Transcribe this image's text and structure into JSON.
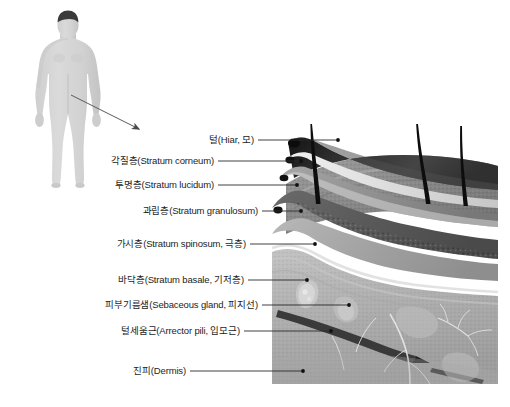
{
  "document": {
    "kind": "anatomy-diagram",
    "subject": "Skin cross-section (피부 단면)",
    "language": "ko"
  },
  "figure": {
    "name": "human-body-silhouette",
    "body_color": "#d3d3d3",
    "hair_color": "#3a3a3a",
    "shadow_color": "#c3c3c3"
  },
  "pointer": {
    "name": "zoom-arrow",
    "color": "#4a4a4a",
    "from": "body-abdomen",
    "to": "skin-illustration"
  },
  "labels": [
    {
      "ko": "털",
      "en": "(Hiar, 모)",
      "text": "털(Hiar, 모)"
    },
    {
      "ko": "각질층",
      "en": "(Stratum corneum)",
      "text": "각질층(Stratum corneum)"
    },
    {
      "ko": "투명층",
      "en": "(Stratum lucidum)",
      "text": "투명층(Stratum lucidum)"
    },
    {
      "ko": "과립층",
      "en": "(Stratum granulosum)",
      "text": "과립층(Stratum granulosum)"
    },
    {
      "ko": "가시층",
      "en": "(Stratum spinosum, 극층)",
      "text": "가시층(Stratum spinosum, 극층)"
    },
    {
      "ko": "바닥층",
      "en": "(Stratum basale, 기저층)",
      "text": "바닥층(Stratum basale, 기저층)"
    },
    {
      "ko": "피부기름샘",
      "en": "(Sebaceous gland, 피지선)",
      "text": "피부기름샘(Sebaceous gland, 피지선)"
    },
    {
      "ko": "털세움근",
      "en": "(Arrector pili, 입모근)",
      "text": "털세움근(Arrector pili, 입모근)"
    },
    {
      "ko": "진피",
      "en": "(Dermis)",
      "text": "진피(Dermis)"
    }
  ],
  "leader_line": {
    "color": "#2b2b2b",
    "dot_color": "#111111",
    "width_px": 0.9
  },
  "illustration": {
    "name": "skin-cross-section-render",
    "style": "grayscale 3D medical render",
    "layers": [
      {
        "name": "stratum-corneum",
        "tone": "#2c2c2c"
      },
      {
        "name": "stratum-lucidum",
        "tone": "#e9e9e9"
      },
      {
        "name": "stratum-granulosum",
        "tone": "#9a9a9a"
      },
      {
        "name": "stratum-spinosum",
        "tone": "#6e6e6e"
      },
      {
        "name": "stratum-basale",
        "tone": "#888888"
      },
      {
        "name": "dermis",
        "tone": "#b4b4b4"
      }
    ],
    "structures": [
      "hair-shaft",
      "hair-follicle",
      "sebaceous-gland",
      "arrector-pili-muscle",
      "nerve-branch",
      "blood-vessel"
    ],
    "hair_count": 3
  },
  "bottom_caption": {
    "left": "",
    "right": ""
  }
}
